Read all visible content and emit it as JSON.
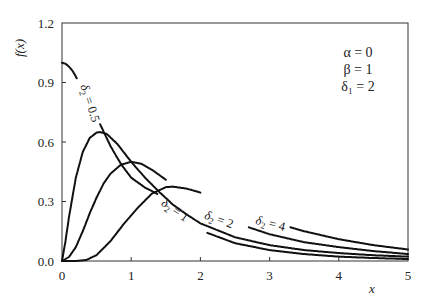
{
  "chart_data": {
    "type": "line",
    "title": "",
    "xlabel": "x",
    "ylabel": "f(x)",
    "xlim": [
      0,
      5
    ],
    "ylim": [
      0,
      1.2
    ],
    "grid": false,
    "x_ticks": [
      "0",
      "1",
      "2",
      "3",
      "4",
      "5"
    ],
    "y_ticks": [
      "0.0",
      "0.3",
      "0.6",
      "0.9",
      "1.2"
    ],
    "parameters": [
      "α = 0",
      "β = 1",
      "δ₁ = 2"
    ],
    "series": [
      {
        "name": "δ₂ = 0.5",
        "points": [
          [
            0,
            1.0
          ],
          [
            0.05,
            0.995
          ],
          [
            0.1,
            0.98
          ],
          [
            0.15,
            0.96
          ],
          [
            0.2,
            0.93
          ],
          [
            0.3,
            0.86
          ],
          [
            0.4,
            0.78
          ],
          [
            0.5,
            0.72
          ],
          [
            0.55,
            0.69
          ],
          [
            0.7,
            0.58
          ],
          [
            0.85,
            0.49
          ],
          [
            1.0,
            0.42
          ],
          [
            1.2,
            0.37
          ],
          [
            1.37,
            0.34
          ],
          [
            1.6,
            0.27
          ],
          [
            1.8,
            0.2
          ],
          [
            2.0,
            0.155
          ],
          [
            2.5,
            0.09
          ],
          [
            3.0,
            0.055
          ],
          [
            3.5,
            0.035
          ],
          [
            4.0,
            0.022
          ],
          [
            4.5,
            0.015
          ],
          [
            5.0,
            0.01
          ]
        ],
        "gaps": [
          [
            0.22,
            0.54
          ],
          [
            1.38,
            2.1
          ]
        ],
        "label": {
          "text_prefix": "δ",
          "sub": "2",
          "text_suffix": " = 0.5",
          "x": 0.35,
          "y": 0.79,
          "angle": 72
        }
      },
      {
        "name": "δ₂ = 1",
        "points": [
          [
            0,
            0
          ],
          [
            0.05,
            0.1
          ],
          [
            0.1,
            0.22
          ],
          [
            0.2,
            0.42
          ],
          [
            0.3,
            0.55
          ],
          [
            0.4,
            0.62
          ],
          [
            0.5,
            0.648
          ],
          [
            0.55,
            0.65
          ],
          [
            0.65,
            0.64
          ],
          [
            0.8,
            0.59
          ],
          [
            1.0,
            0.5
          ],
          [
            1.2,
            0.42
          ],
          [
            1.4,
            0.35
          ],
          [
            1.6,
            0.285
          ],
          [
            1.8,
            0.235
          ],
          [
            2.0,
            0.19
          ],
          [
            2.5,
            0.12
          ],
          [
            3.0,
            0.08
          ],
          [
            3.5,
            0.055
          ],
          [
            4.0,
            0.04
          ],
          [
            4.5,
            0.029
          ],
          [
            5.0,
            0.022
          ]
        ],
        "gaps": [],
        "label": {
          "text_prefix": "δ",
          "sub": "2",
          "text_suffix": " = 1",
          "x": 1.6,
          "y": 0.24,
          "angle": 35
        }
      },
      {
        "name": "δ₂ = 2",
        "points": [
          [
            0,
            0
          ],
          [
            0.1,
            0.02
          ],
          [
            0.2,
            0.07
          ],
          [
            0.3,
            0.15
          ],
          [
            0.4,
            0.24
          ],
          [
            0.5,
            0.32
          ],
          [
            0.6,
            0.39
          ],
          [
            0.7,
            0.44
          ],
          [
            0.85,
            0.485
          ],
          [
            1.0,
            0.5
          ],
          [
            1.15,
            0.49
          ],
          [
            1.3,
            0.46
          ],
          [
            1.5,
            0.41
          ],
          [
            1.7,
            0.36
          ],
          [
            1.9,
            0.31
          ],
          [
            2.1,
            0.26
          ],
          [
            2.4,
            0.21
          ],
          [
            2.7,
            0.17
          ],
          [
            3.0,
            0.135
          ],
          [
            3.5,
            0.095
          ],
          [
            4.0,
            0.07
          ],
          [
            4.5,
            0.05
          ],
          [
            5.0,
            0.035
          ]
        ],
        "gaps": [
          [
            1.5,
            2.7
          ]
        ],
        "label": {
          "text_prefix": "δ",
          "sub": "2",
          "text_suffix": " = 2",
          "x": 2.25,
          "y": 0.19,
          "angle": 20
        }
      },
      {
        "name": "δ₂ = 4",
        "points": [
          [
            0,
            0
          ],
          [
            0.2,
            0.0
          ],
          [
            0.35,
            0.005
          ],
          [
            0.5,
            0.03
          ],
          [
            0.7,
            0.1
          ],
          [
            0.9,
            0.19
          ],
          [
            1.1,
            0.27
          ],
          [
            1.3,
            0.34
          ],
          [
            1.5,
            0.372
          ],
          [
            1.6,
            0.375
          ],
          [
            1.8,
            0.365
          ],
          [
            2.0,
            0.345
          ],
          [
            2.3,
            0.3
          ],
          [
            2.6,
            0.255
          ],
          [
            2.9,
            0.215
          ],
          [
            3.2,
            0.18
          ],
          [
            3.5,
            0.15
          ],
          [
            4.0,
            0.11
          ],
          [
            4.5,
            0.08
          ],
          [
            5.0,
            0.058
          ]
        ],
        "gaps": [
          [
            2.0,
            3.3
          ]
        ],
        "label": {
          "text_prefix": "δ",
          "sub": "2",
          "text_suffix": " = 4",
          "x": 3.0,
          "y": 0.17,
          "angle": 14
        }
      }
    ],
    "legend_position": "top-right (parameter block)"
  }
}
